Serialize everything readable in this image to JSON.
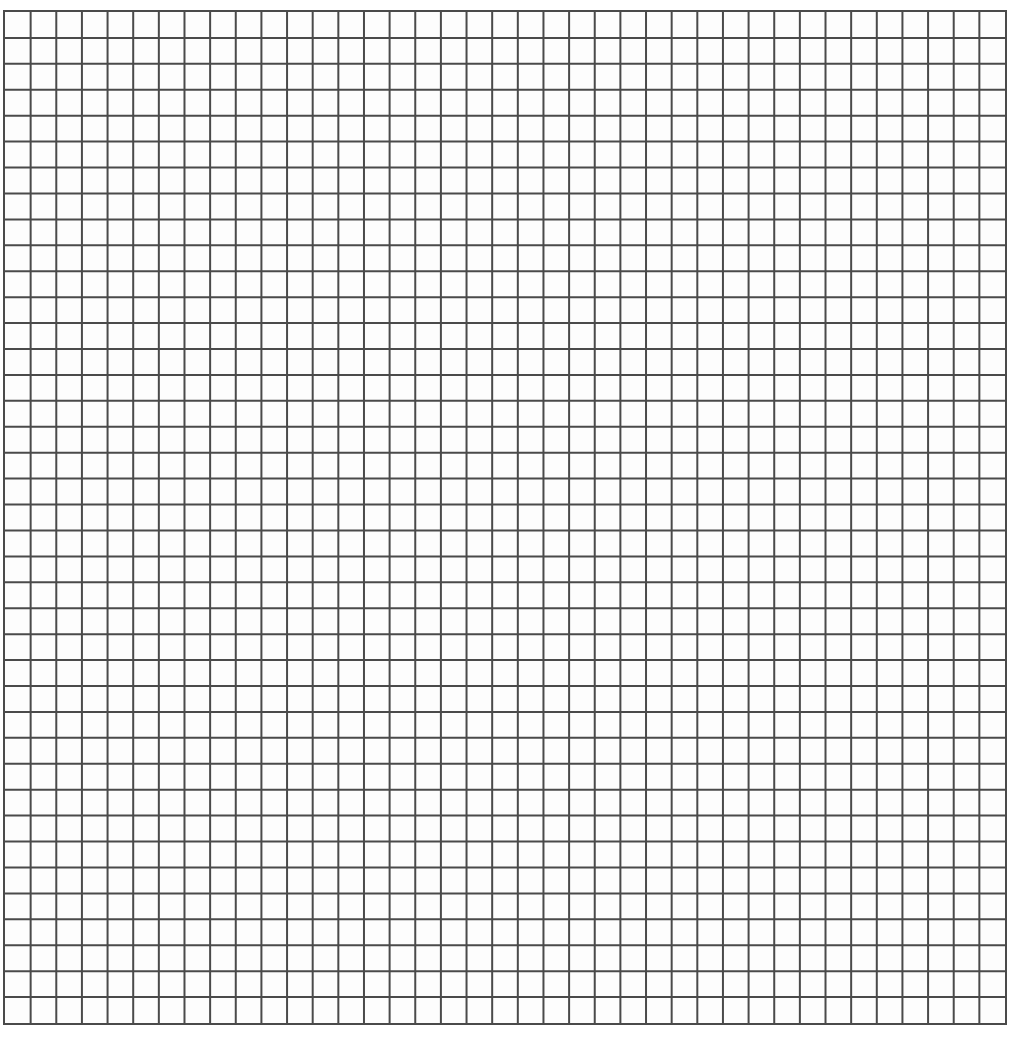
{
  "grid": {
    "columns": 39,
    "rows": 39,
    "line_color": "#4a4a4a",
    "background": "#fdfdfd"
  }
}
